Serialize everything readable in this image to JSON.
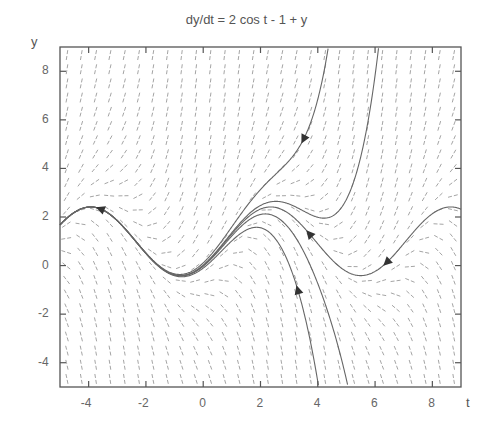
{
  "chart_data": {
    "type": "line",
    "subtype": "direction-field",
    "title": "dy/dt = 2 cos t  - 1 + y",
    "xlabel": "t",
    "ylabel": "y",
    "xlim": [
      -5,
      9
    ],
    "ylim": [
      -5,
      9
    ],
    "xticks": [
      -4,
      -2,
      0,
      2,
      4,
      6,
      8
    ],
    "yticks": [
      -4,
      -2,
      0,
      2,
      4,
      6,
      8
    ],
    "grid": false,
    "equation": {
      "cos_coef": 2,
      "const": -1,
      "y_coef": 1
    },
    "slope_field": {
      "cols": 28,
      "rows": 24,
      "segment_px": 12,
      "color": "#9a9a9a"
    },
    "solution_family": "y = 1 - cos t + sin t + K e^t",
    "series": [
      {
        "name": "periodic solution",
        "K": 0,
        "t_range": [
          -5,
          9
        ],
        "arrows": [
          {
            "t": -3.6,
            "y": 2.34
          },
          {
            "t": 3.7,
            "y": 1.3
          },
          {
            "t": 6.4,
            "y": 0.2
          }
        ]
      },
      {
        "name": "escaping upward",
        "K": 0.109,
        "t_range": [
          -5,
          9
        ],
        "arrows": [
          {
            "t": 3.5,
            "y": 5.2
          }
        ]
      },
      {
        "name": "escaping downward",
        "K": -0.104,
        "t_range": [
          -5,
          9
        ],
        "arrows": [
          {
            "t": 3.3,
            "y": -1.0
          }
        ]
      },
      {
        "name": "near-periodic upper",
        "K": 0.02,
        "t_range": [
          -5,
          9
        ],
        "arrows": []
      },
      {
        "name": "near-periodic lower",
        "K": -0.03,
        "t_range": [
          -5,
          9
        ],
        "arrows": []
      }
    ],
    "colors": {
      "curve": "#666666",
      "axis": "#555555",
      "arrow": "#333333"
    }
  },
  "labels": {
    "title": "dy/dt = 2 cos t  - 1 + y",
    "x_axis": "t",
    "y_axis": "y"
  }
}
